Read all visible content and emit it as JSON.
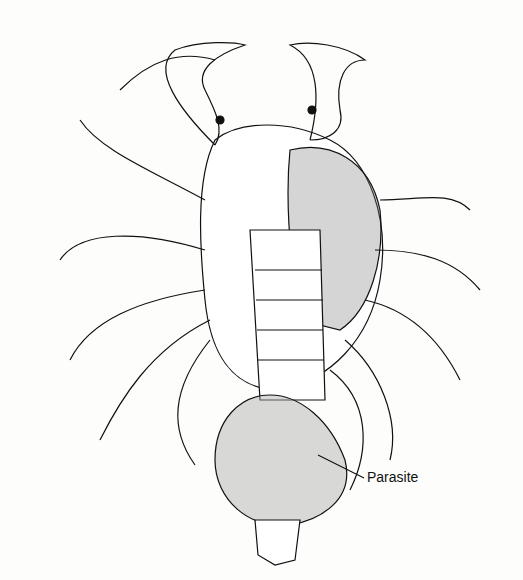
{
  "figure": {
    "labels": [
      {
        "text": "Parasite"
      }
    ]
  }
}
